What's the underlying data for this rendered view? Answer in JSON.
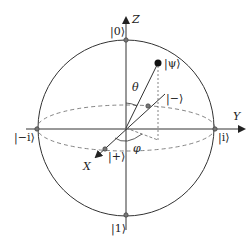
{
  "diagram": {
    "type": "bloch-sphere",
    "axes": {
      "z_label": "Z",
      "y_label": "Y",
      "x_label": "X"
    },
    "states": {
      "zero": "|0⟩",
      "one": "|1⟩",
      "plus": "|+⟩",
      "minus": "|−⟩",
      "i": "|i⟩",
      "minus_i": "|−i⟩",
      "psi": "|ψ⟩"
    },
    "angles": {
      "theta": "θ",
      "phi": "φ"
    },
    "colors": {
      "stroke": "#222222",
      "dashed": "#555555",
      "point_fill": "#777777"
    }
  }
}
